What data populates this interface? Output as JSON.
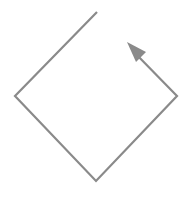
{
  "diagram": {
    "stroke_color": "#8a8a8a",
    "arrow_color": "#8a8a8a",
    "path_kind": "open-diamond-loop-arrow"
  }
}
